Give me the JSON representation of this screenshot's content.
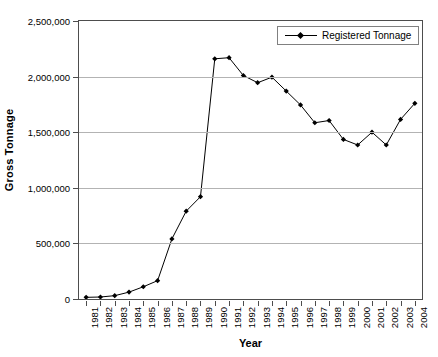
{
  "chart_data": {
    "type": "line",
    "title": "",
    "xlabel": "Year",
    "ylabel": "Gross Tonnage",
    "ylim": [
      0,
      2500000
    ],
    "ytick_labels": [
      "0",
      "500,000",
      "1,000,000",
      "1,500,000",
      "2,000,000",
      "2,500,000"
    ],
    "ytick_values": [
      0,
      500000,
      1000000,
      1500000,
      2000000,
      2500000
    ],
    "grid": "horizontal",
    "legend_position": "top-right",
    "legend": [
      "Registered Tonnage"
    ],
    "marker": "diamond",
    "line_color": "#000000",
    "marker_color": "#000000",
    "categories": [
      "1981",
      "1982",
      "1983",
      "1984",
      "1985",
      "1986",
      "1987",
      "1988",
      "1989",
      "1990",
      "1991",
      "1992",
      "1993",
      "1994",
      "1995",
      "1996",
      "1997",
      "1998",
      "1999",
      "2000",
      "2001",
      "2002",
      "2003",
      "2004"
    ],
    "series": [
      {
        "name": "Registered Tonnage",
        "values": [
          15000,
          18000,
          30000,
          62000,
          110000,
          165000,
          540000,
          790000,
          920000,
          2160000,
          2170000,
          2010000,
          1945000,
          1995000,
          1870000,
          1745000,
          1585000,
          1605000,
          1435000,
          1385000,
          1500000,
          1385000,
          1615000,
          1760000
        ]
      }
    ]
  },
  "axes": {
    "y_title": "Gross Tonnage",
    "x_title": "Year"
  },
  "legend": {
    "entries": [
      {
        "label": "Registered Tonnage",
        "marker_icon": "diamond-marker-icon"
      }
    ]
  },
  "colors": {
    "series": "#000000",
    "gridline": "#b3b3b3",
    "axis": "#4d4d4d",
    "legend_border": "#808080",
    "background": "#ffffff"
  }
}
